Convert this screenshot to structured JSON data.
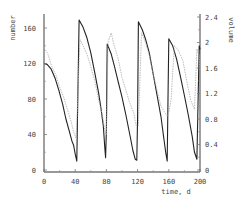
{
  "chart_data": {
    "type": "line",
    "title": "",
    "xlabel": "time, d",
    "ylabel": "number",
    "y2label": "volume",
    "xlim": [
      0,
      200
    ],
    "ylim": [
      0,
      160
    ],
    "y2lim": [
      0,
      2.4
    ],
    "x_ticks": [
      "0",
      "40",
      "80",
      "120",
      "160",
      "200"
    ],
    "y_ticks": [
      "0",
      "40",
      "80",
      "120",
      "160"
    ],
    "y2_ticks": [
      "0",
      "0.4",
      "0.8",
      "1.2",
      "1.6",
      "2",
      "2.4"
    ],
    "grid": false,
    "legend": "none",
    "series": [
      {
        "name": "number",
        "axis": "left",
        "style": "solid",
        "color": "#222222",
        "x": [
          0,
          4,
          9,
          14,
          19,
          24,
          28,
          32,
          36,
          38,
          40,
          41,
          42,
          43,
          45,
          50,
          55,
          60,
          65,
          70,
          73,
          76,
          78,
          79,
          80,
          81,
          86,
          90,
          95,
          100,
          105,
          110,
          114,
          117,
          119,
          120,
          121,
          126,
          130,
          135,
          140,
          145,
          150,
          153,
          156,
          158,
          159,
          160,
          165,
          170,
          175,
          180,
          185,
          190,
          193,
          196,
          199,
          200
        ],
        "y": [
          120,
          119,
          114,
          104,
          90,
          74,
          58,
          45,
          32,
          28,
          18,
          14,
          10,
          60,
          169,
          161,
          149,
          132,
          110,
          87,
          70,
          50,
          25,
          14,
          45,
          142,
          131,
          118,
          100,
          82,
          62,
          40,
          22,
          12,
          11,
          60,
          167,
          158,
          148,
          132,
          108,
          84,
          60,
          40,
          20,
          10,
          80,
          148,
          140,
          125,
          105,
          84,
          62,
          38,
          20,
          12,
          140,
          136
        ]
      },
      {
        "name": "volume",
        "axis": "right",
        "style": "dotted",
        "color": "#aaaaaa",
        "x": [
          0,
          5,
          10,
          15,
          20,
          25,
          30,
          35,
          38,
          41,
          43,
          46,
          50,
          55,
          60,
          65,
          70,
          75,
          78,
          80,
          82,
          86,
          90,
          95,
          100,
          105,
          110,
          115,
          118,
          121,
          125,
          130,
          135,
          140,
          145,
          150,
          155,
          158,
          160,
          163,
          167,
          172,
          178,
          183,
          188,
          193,
          196,
          199,
          200
        ],
        "y": [
          1.92,
          1.82,
          1.62,
          1.5,
          1.3,
          1.15,
          0.95,
          0.75,
          0.6,
          0.5,
          1.0,
          2.05,
          1.95,
          1.82,
          1.62,
          1.4,
          1.1,
          0.85,
          0.62,
          0.55,
          2.0,
          2.15,
          1.95,
          1.75,
          1.45,
          1.25,
          1.05,
          0.9,
          0.7,
          0.7,
          2.15,
          2.0,
          1.8,
          1.5,
          1.25,
          1.0,
          0.9,
          0.85,
          0.9,
          1.1,
          1.95,
          1.88,
          1.72,
          1.4,
          1.1,
          0.95,
          1.9,
          1.78,
          1.55
        ]
      }
    ]
  },
  "labels": {
    "xlabel": "time, d",
    "ylabel": "number",
    "y2label": "volume"
  }
}
